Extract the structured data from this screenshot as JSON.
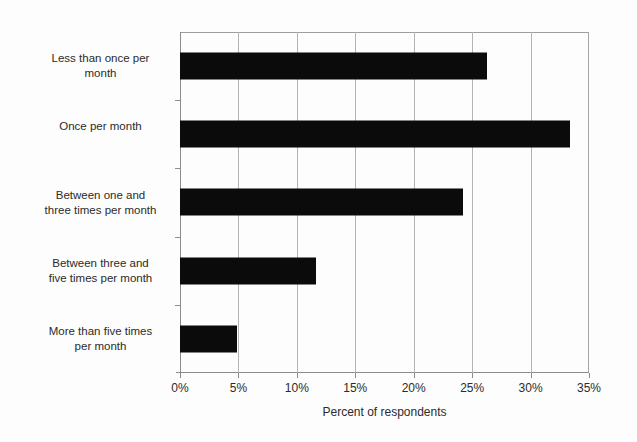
{
  "chart_data": {
    "type": "bar",
    "orientation": "horizontal",
    "title": "",
    "subtitle": "",
    "xlabel": "Percent of respondents",
    "ylabel": "",
    "categories": [
      "Less than once per\nmonth",
      "Once per month",
      "Between one and\nthree times per month",
      "Between three and\nfive times per month",
      "More than five times\nper month"
    ],
    "values": [
      26.3,
      33.4,
      24.2,
      11.6,
      4.9
    ],
    "value_unit": "%",
    "xlim": [
      0,
      35
    ],
    "xticks": [
      0,
      5,
      10,
      15,
      20,
      25,
      30,
      35
    ],
    "xtick_labels": [
      "0%",
      "5%",
      "10%",
      "15%",
      "20%",
      "25%",
      "30%",
      "35%"
    ],
    "grid": "vertical",
    "legend": "none",
    "bar_color": "#0b0b0b",
    "gridline_color": "#b4b4b4",
    "axis_color": "#8b8b8b",
    "background_color": "#fdfdfd",
    "data_labels": false,
    "annotations": []
  }
}
